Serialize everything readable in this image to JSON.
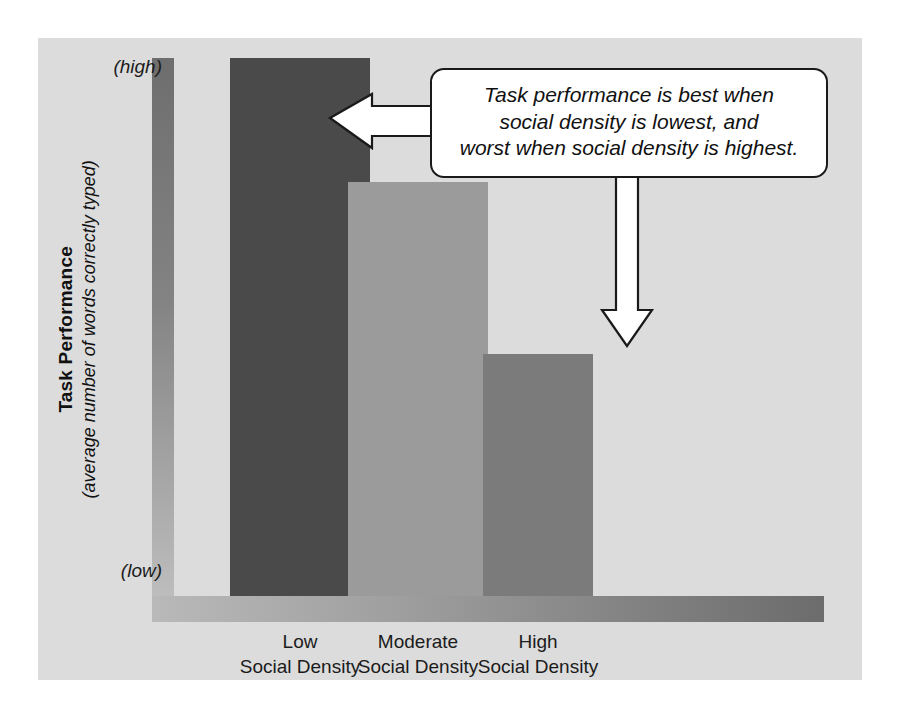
{
  "chart_data": {
    "type": "bar",
    "title": "",
    "subtitle": "",
    "categories": [
      "Low\nSocial Density",
      "Moderate\nSocial Density",
      "High\nSocial Density"
    ],
    "category_lines": [
      {
        "line1": "Low",
        "line2": "Social Density"
      },
      {
        "line1": "Moderate",
        "line2": "Social Density"
      },
      {
        "line1": "High",
        "line2": "Social Density"
      }
    ],
    "values": [
      100,
      77,
      45
    ],
    "xlabel": "",
    "ylabel": "Task Performance",
    "ylabel_sub": "(average number of words correctly typed)",
    "ylim": [
      0,
      100
    ],
    "y_tick_labels": [
      "(low)",
      "(high)"
    ],
    "grid": false,
    "legend": "none",
    "bar_colors": [
      "#4a4a4a",
      "#9b9b9b",
      "#7b7b7b"
    ],
    "series": [
      {
        "name": "Task performance",
        "values": [
          100,
          77,
          45
        ]
      }
    ],
    "annotations": [
      {
        "type": "callout",
        "lines": [
          "Task performance is best when",
          "social density is lowest, and",
          "worst when social density is highest."
        ],
        "points_to": [
          "Low Social Density",
          "High Social Density"
        ]
      }
    ]
  },
  "axis": {
    "y_high_label": "(high)",
    "y_low_label": "(low)",
    "y_title_main": "Task Performance",
    "y_title_sub": "(average number of words correctly typed)"
  },
  "callout": {
    "line1": "Task performance is best when",
    "line2": "social density is lowest, and",
    "line3": "worst when social density is highest."
  },
  "colors": {
    "panel_background": "#dcdcdc",
    "page_background": "#ffffff",
    "bar_low": "#4a4a4a",
    "bar_moderate": "#9b9b9b",
    "bar_high": "#7b7b7b",
    "axis_dark": "#6e6e6e",
    "axis_light": "#bdbdbd",
    "text": "#111111",
    "callout_border": "#1a1a1a",
    "arrow_fill": "#ffffff"
  }
}
